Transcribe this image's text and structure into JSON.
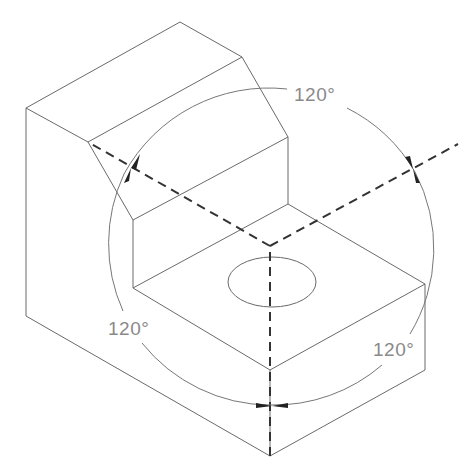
{
  "diagram": {
    "labels": [
      {
        "id": "angle_top",
        "text": "120°"
      },
      {
        "id": "angle_left",
        "text": "120°"
      },
      {
        "id": "angle_right",
        "text": "120°"
      }
    ],
    "colors": {
      "edges": "#6a6a6a",
      "axes": "#333333",
      "labels": "#8a8a8a",
      "background": "#ffffff"
    }
  }
}
